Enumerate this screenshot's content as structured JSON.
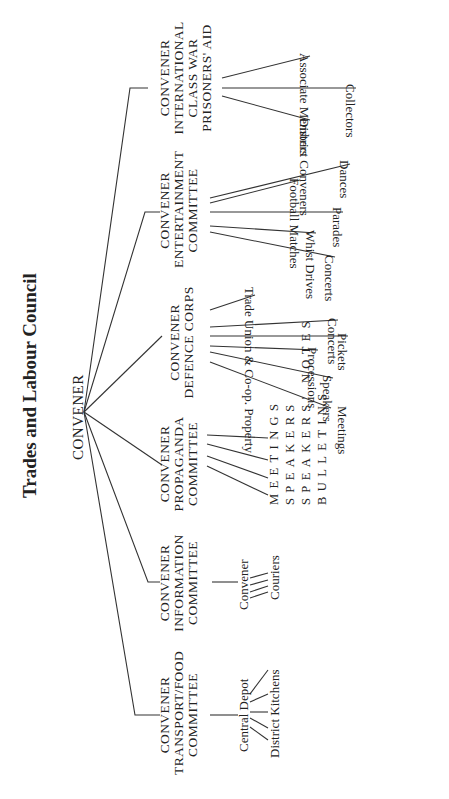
{
  "title": "Trades and Labour Council",
  "root": {
    "label": "CONVENER"
  },
  "committees": [
    {
      "id": "transport",
      "lines": [
        "CONVENER",
        "TRANSPORT/FOOD",
        "COMMITTEE"
      ],
      "children": [
        "Central Depot",
        "District Kitchens"
      ]
    },
    {
      "id": "information",
      "lines": [
        "CONVENER",
        "INFORMATION",
        "COMMITTEE"
      ],
      "children": [
        "Convener",
        "Couriers"
      ]
    },
    {
      "id": "propaganda",
      "lines": [
        "CONVENER",
        "PROPAGANDA",
        "COMMITTEE"
      ],
      "children": [
        "MEETINGS",
        "SPEAKERS",
        "SPEAKERS' NOTES",
        "BULLETINS"
      ]
    },
    {
      "id": "defence",
      "lines": [
        "CONVENER",
        "DEFENCE CORPS"
      ],
      "children": [
        "Meetings",
        "Speakers",
        "Processions",
        "Pickets",
        "Concerts",
        "Trade Union & Co-op. Property"
      ]
    },
    {
      "id": "entertainment",
      "lines": [
        "CONVENER",
        "ENTERTAINMENT",
        "COMMITTEE"
      ],
      "children": [
        "Concerts",
        "Whist Drives",
        "Parades",
        "Football Matches",
        "Dances"
      ]
    },
    {
      "id": "international",
      "lines": [
        "CONVENER",
        "INTERNATIONAL",
        "CLASS WAR",
        "PRISONERS' AID"
      ],
      "children": [
        "District Conveners",
        "Collectors",
        "Associate Members"
      ]
    }
  ],
  "colors": {
    "line": "#333333",
    "text": "#222222",
    "background": "#ffffff"
  }
}
